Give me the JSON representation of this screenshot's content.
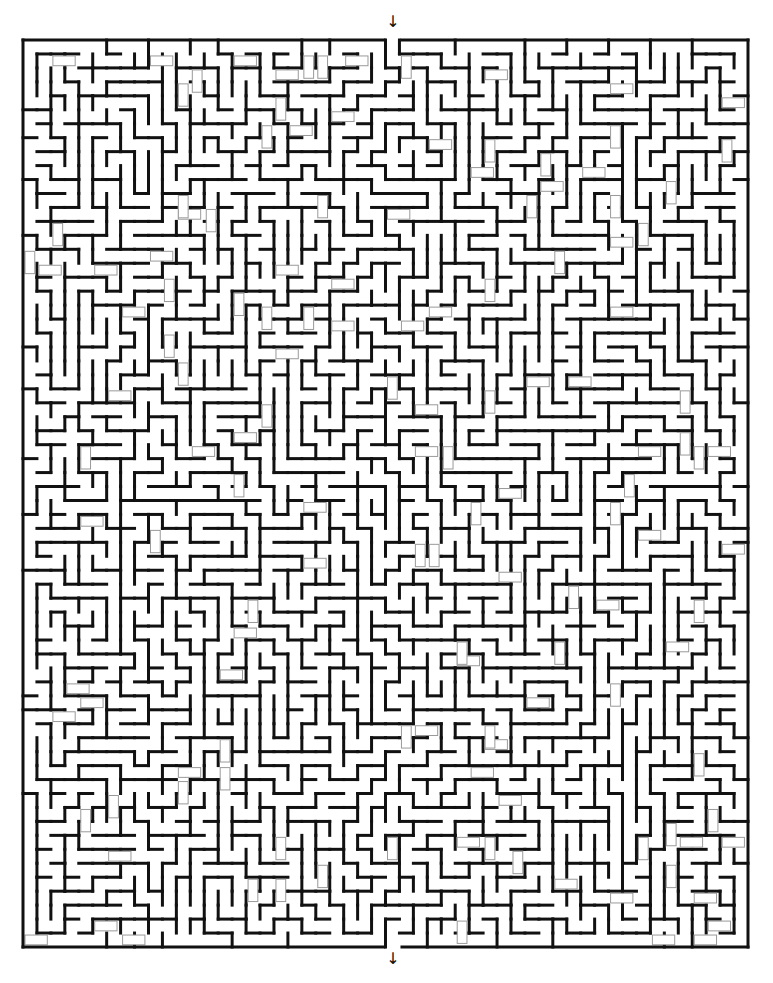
{
  "puzzle": {
    "type": "maze",
    "entrance_marker": "↓",
    "exit_marker": "↓",
    "grid": {
      "cols": 52,
      "rows": 65
    },
    "bounds": {
      "left": 23,
      "top": 40,
      "right": 748,
      "bottom": 947
    },
    "entrance_x": 393,
    "exit_x": 393,
    "colors": {
      "wall": "#111111",
      "background": "#ffffff",
      "bridge": "#9a9a9a"
    }
  }
}
